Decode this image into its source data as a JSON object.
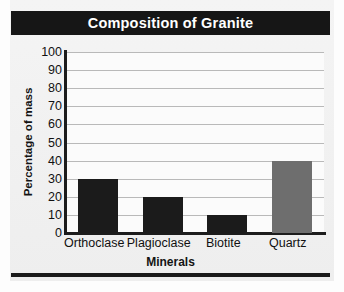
{
  "chart_data": {
    "type": "bar",
    "title": "Composition of Granite",
    "xlabel": "Minerals",
    "ylabel": "Percentage of mass",
    "categories": [
      "Orthoclase",
      "Plagioclase",
      "Biotite",
      "Quartz"
    ],
    "values": [
      30,
      20,
      10,
      40
    ],
    "bar_colors": [
      "#1b1b1b",
      "#1b1b1b",
      "#1b1b1b",
      "#6e6e6e"
    ],
    "ylim": [
      0,
      100
    ],
    "ytick_step": 10,
    "ytick_labels": [
      "100",
      "90",
      "80",
      "70",
      "60",
      "50",
      "40",
      "30",
      "20",
      "10",
      "0"
    ],
    "grid": true,
    "legend": "none"
  },
  "figure": {
    "title_bar_bg": "#161616",
    "title_text_color": "#ffffff",
    "panel_bg": "#f2f2f2",
    "plot_bg": "#fbfbfb",
    "axis_color": "#1c1c1c",
    "gridline_color": "#b9b9b9"
  }
}
